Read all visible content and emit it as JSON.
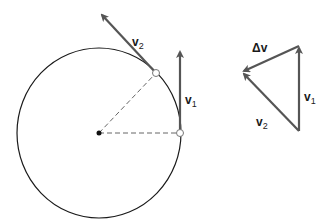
{
  "diagram": {
    "colors": {
      "circle": "#1a1a1a",
      "vector": "#555555",
      "radius_dash": "#666666",
      "center_dot": "#111111",
      "point_marker": "#777777"
    },
    "circle": {
      "cx": 99,
      "cy": 133,
      "rx": 82,
      "ry": 85
    },
    "labels": {
      "v2_circle": {
        "main": "v",
        "sub": "2"
      },
      "v1_circle": {
        "main": "v",
        "sub": "1"
      },
      "delta_v": {
        "main": "Δv"
      },
      "v1_triangle": {
        "main": "v",
        "sub": "1"
      },
      "v2_triangle": {
        "main": "v",
        "sub": "2"
      }
    }
  }
}
